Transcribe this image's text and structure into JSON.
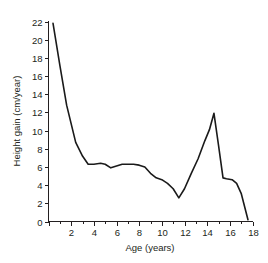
{
  "chart_data": {
    "type": "line",
    "title": "",
    "xlabel": "Age (years)",
    "ylabel": "Height gain (cm/year)",
    "xlim": [
      0,
      18
    ],
    "ylim": [
      0,
      22
    ],
    "grid": false,
    "legend": null,
    "x_ticks": [
      0,
      2,
      4,
      6,
      8,
      10,
      12,
      14,
      16,
      18
    ],
    "x_tick_labels": [
      "",
      "2",
      "4",
      "6",
      "8",
      "10",
      "12",
      "14",
      "16",
      "18"
    ],
    "x_minor_tick_step": 1,
    "y_ticks": [
      0,
      2,
      4,
      6,
      8,
      10,
      12,
      14,
      16,
      18,
      20,
      22
    ],
    "y_tick_labels": [
      "0",
      "2",
      "4",
      "6",
      "8",
      "10",
      "12",
      "14",
      "16",
      "18",
      "20",
      "22"
    ],
    "line_color": "#1a1a1a",
    "series": [
      {
        "name": "Height velocity",
        "x": [
          0.4,
          1.0,
          1.6,
          2.4,
          3.0,
          3.5,
          4.0,
          4.6,
          5.0,
          5.5,
          6.0,
          6.5,
          7.0,
          7.5,
          8.0,
          8.5,
          9.0,
          9.5,
          10.0,
          10.5,
          11.0,
          11.5,
          12.0,
          12.6,
          13.2,
          13.8,
          14.2,
          14.6,
          15.0,
          15.4,
          15.7,
          16.2,
          16.6,
          17.0,
          17.6
        ],
        "y": [
          21.8,
          17.2,
          12.8,
          8.7,
          7.2,
          6.3,
          6.3,
          6.4,
          6.3,
          5.9,
          6.1,
          6.3,
          6.3,
          6.3,
          6.2,
          6.0,
          5.3,
          4.8,
          4.6,
          4.2,
          3.6,
          2.6,
          3.6,
          5.3,
          6.9,
          8.9,
          10.1,
          11.9,
          8.4,
          4.8,
          4.7,
          4.6,
          4.2,
          3.1,
          0.2
        ]
      }
    ]
  },
  "axes": {
    "x_title": "Age (years)",
    "y_title": "Height gain (cm/year)"
  }
}
